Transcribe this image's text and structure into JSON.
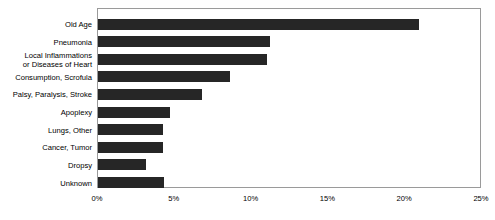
{
  "chart_data": {
    "type": "bar",
    "orientation": "horizontal",
    "title": "",
    "xlabel": "",
    "ylabel": "",
    "xlim": [
      0,
      25
    ],
    "xunit": "%",
    "grid": false,
    "legend": null,
    "bar_color": "#262626",
    "frame_color": "#9a9a9a",
    "categories": [
      "Old Age",
      "Pneumonia",
      "Local Inflammations\nor Diseases of Heart",
      "Consumption, Scrofula",
      "Palsy, Paralysis, Stroke",
      "Apoplexy",
      "Lungs, Other",
      "Cancer, Tumor",
      "Dropsy",
      "Unknown"
    ],
    "values": [
      20.9,
      11.2,
      11.0,
      8.6,
      6.8,
      4.7,
      4.2,
      4.2,
      3.1,
      4.3
    ],
    "xticks": [
      0,
      5,
      10,
      15,
      20,
      25
    ],
    "xticklabels": [
      "0%",
      "5%",
      "10%",
      "15%",
      "20%",
      "25%"
    ]
  },
  "labels": {
    "cat0": "Old Age",
    "cat1": "Pneumonia",
    "cat2_line1": "Local Inflammations",
    "cat2_line2": "or Diseases of Heart",
    "cat3": "Consumption, Scrofula",
    "cat4": "Palsy, Paralysis, Stroke",
    "cat5": "Apoplexy",
    "cat6": "Lungs, Other",
    "cat7": "Cancer, Tumor",
    "cat8": "Dropsy",
    "cat9": "Unknown"
  },
  "xaxis": {
    "t0": "0%",
    "t1": "5%",
    "t2": "10%",
    "t3": "15%",
    "t4": "20%",
    "t5": "25%"
  }
}
